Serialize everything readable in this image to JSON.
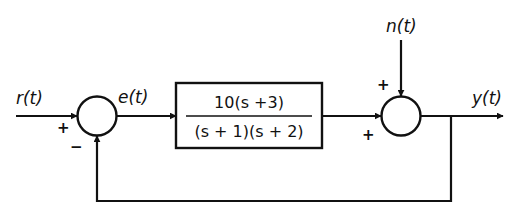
{
  "diagram": {
    "type": "closed-loop feedback control block diagram",
    "colors": {
      "background": "#ffffff",
      "stroke": "#111111"
    },
    "signals": {
      "input": "r(t)",
      "error": "e(t)",
      "disturbance": "n(t)",
      "output": "y(t)"
    },
    "plant": {
      "numerator": "10(s +3)",
      "denominator": "(s + 1)(s + 2)"
    },
    "summing_junction_1": {
      "input_sign": "+",
      "feedback_sign": "−"
    },
    "summing_junction_2": {
      "plant_sign": "+",
      "disturbance_sign": "+"
    }
  }
}
